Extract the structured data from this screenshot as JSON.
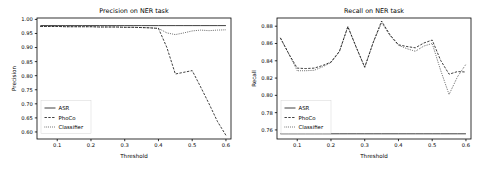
{
  "figure": {
    "background": "#ffffff",
    "line_color": "#000000"
  },
  "chart_data": [
    {
      "type": "line",
      "title": "Precision on NER task",
      "xlabel": "Threshold",
      "ylabel": "Precision",
      "xlim": [
        0.04,
        0.615
      ],
      "ylim": [
        0.575,
        1.005
      ],
      "xticks": [
        0.1,
        0.2,
        0.3,
        0.4,
        0.5,
        0.6
      ],
      "xticklabels": [
        "0.1",
        "0.2",
        "0.3",
        "0.4",
        "0.5",
        "0.6"
      ],
      "yticks": [
        0.6,
        0.65,
        0.7,
        0.75,
        0.8,
        0.85,
        0.9,
        0.95,
        1.0
      ],
      "yticklabels": [
        "0.60",
        "0.65",
        "0.70",
        "0.75",
        "0.80",
        "0.85",
        "0.90",
        "0.95",
        "1.00"
      ],
      "grid": false,
      "legend_position": "lower left",
      "x": [
        0.05,
        0.075,
        0.1,
        0.125,
        0.15,
        0.175,
        0.2,
        0.225,
        0.25,
        0.275,
        0.3,
        0.325,
        0.35,
        0.375,
        0.4,
        0.425,
        0.45,
        0.475,
        0.5,
        0.525,
        0.55,
        0.575,
        0.6
      ],
      "series": [
        {
          "name": "ASR",
          "style": "solid",
          "values": [
            0.978,
            0.978,
            0.978,
            0.978,
            0.978,
            0.978,
            0.978,
            0.978,
            0.978,
            0.978,
            0.978,
            0.978,
            0.978,
            0.978,
            0.978,
            0.978,
            0.978,
            0.978,
            0.978,
            0.978,
            0.978,
            0.978,
            0.978
          ]
        },
        {
          "name": "PhoCo",
          "style": "dashed",
          "values": [
            0.975,
            0.975,
            0.975,
            0.974,
            0.974,
            0.974,
            0.974,
            0.973,
            0.973,
            0.973,
            0.972,
            0.972,
            0.971,
            0.97,
            0.968,
            0.9,
            0.806,
            0.812,
            0.818,
            0.76,
            0.7,
            0.637,
            0.588
          ]
        },
        {
          "name": "Classifier",
          "style": "dotted",
          "values": [
            0.975,
            0.975,
            0.975,
            0.974,
            0.974,
            0.974,
            0.974,
            0.973,
            0.973,
            0.973,
            0.972,
            0.972,
            0.971,
            0.97,
            0.968,
            0.952,
            0.946,
            0.952,
            0.959,
            0.962,
            0.96,
            0.962,
            0.963
          ]
        }
      ]
    },
    {
      "type": "line",
      "title": "Recall on NER task",
      "xlabel": "Threshold",
      "ylabel": "Recall",
      "xlim": [
        0.04,
        0.615
      ],
      "ylim": [
        0.7495,
        0.8895
      ],
      "xticks": [
        0.1,
        0.2,
        0.3,
        0.4,
        0.5,
        0.6
      ],
      "xticklabels": [
        "0.1",
        "0.2",
        "0.3",
        "0.4",
        "0.5",
        "0.6"
      ],
      "yticks": [
        0.76,
        0.78,
        0.8,
        0.82,
        0.84,
        0.86,
        0.88
      ],
      "yticklabels": [
        "0.76",
        "0.78",
        "0.80",
        "0.82",
        "0.84",
        "0.86",
        "0.88"
      ],
      "grid": false,
      "legend_position": "lower left",
      "x": [
        0.05,
        0.075,
        0.1,
        0.125,
        0.15,
        0.175,
        0.2,
        0.225,
        0.25,
        0.275,
        0.3,
        0.325,
        0.35,
        0.375,
        0.4,
        0.425,
        0.45,
        0.475,
        0.5,
        0.525,
        0.55,
        0.575,
        0.6
      ],
      "series": [
        {
          "name": "ASR",
          "style": "solid",
          "values": [
            0.7555,
            0.7555,
            0.7555,
            0.7555,
            0.7555,
            0.7555,
            0.7555,
            0.7555,
            0.7555,
            0.7555,
            0.7555,
            0.7555,
            0.7555,
            0.7555,
            0.7555,
            0.7555,
            0.7555,
            0.7555,
            0.7555,
            0.7555,
            0.7555,
            0.7555,
            0.7555
          ]
        },
        {
          "name": "PhoCo",
          "style": "dashed",
          "values": [
            0.8665,
            0.848,
            0.8315,
            0.831,
            0.8315,
            0.8345,
            0.8385,
            0.851,
            0.8795,
            0.8555,
            0.8325,
            0.861,
            0.886,
            0.87,
            0.8585,
            0.8565,
            0.855,
            0.8605,
            0.864,
            0.8405,
            0.8245,
            0.8275,
            0.827
          ]
        },
        {
          "name": "Classifier",
          "style": "dotted",
          "values": [
            0.8665,
            0.848,
            0.8285,
            0.8285,
            0.829,
            0.833,
            0.838,
            0.8505,
            0.8795,
            0.8555,
            0.8325,
            0.861,
            0.884,
            0.869,
            0.858,
            0.854,
            0.851,
            0.857,
            0.86,
            0.829,
            0.801,
            0.8215,
            0.836
          ]
        }
      ]
    }
  ]
}
